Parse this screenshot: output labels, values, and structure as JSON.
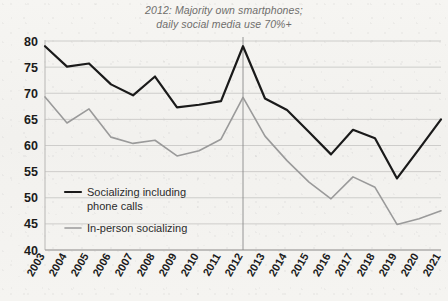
{
  "chart_data": {
    "type": "line",
    "title": "2012: Majority own smartphones; daily social media use 70%+",
    "title_line1": "2012: Majority own smartphones;",
    "title_line2": "daily social media use 70%+",
    "xlabel": "",
    "ylabel": "",
    "ylim": [
      40,
      80
    ],
    "ytick_labels": [
      "40",
      "45",
      "50",
      "55",
      "60",
      "65",
      "70",
      "75",
      "80"
    ],
    "yticks": [
      40,
      45,
      50,
      55,
      60,
      65,
      70,
      75,
      80
    ],
    "grid": "horizontal",
    "legend_position": "inside-lower-left",
    "categories": [
      "2003",
      "2004",
      "2005",
      "2006",
      "2007",
      "2008",
      "2009",
      "2010",
      "2011",
      "2012",
      "2013",
      "2014",
      "2015",
      "2016",
      "2017",
      "2018",
      "2019",
      "2020",
      "2021"
    ],
    "x": [
      2003,
      2004,
      2005,
      2006,
      2007,
      2008,
      2009,
      2010,
      2011,
      2012,
      2013,
      2014,
      2015,
      2016,
      2017,
      2018,
      2019,
      2020,
      2021
    ],
    "annotations": [
      {
        "type": "vertical-reference-line",
        "x": 2012,
        "color": "#8a8a8a"
      }
    ],
    "series": [
      {
        "name": "Socializing including phone calls",
        "legend_label_line1": "Socializing including",
        "legend_label_line2": "phone calls",
        "color": "#1a1a1a",
        "values": [
          79.0,
          75.1,
          75.7,
          71.7,
          69.6,
          73.2,
          67.3,
          67.8,
          68.5,
          79.0,
          69.0,
          66.8,
          62.6,
          58.3,
          63.0,
          61.4,
          53.7,
          59.3,
          65.0
        ]
      },
      {
        "name": "In-person socializing",
        "legend_label_line1": "In-person socializing",
        "legend_label_line2": "",
        "color": "#9a9a9a",
        "values": [
          69.3,
          64.3,
          67.0,
          61.6,
          60.4,
          61.0,
          58.0,
          59.0,
          61.2,
          69.2,
          61.8,
          57.1,
          53.0,
          49.8,
          54.0,
          52.0,
          44.9,
          46.0,
          47.5
        ]
      }
    ]
  },
  "legend": {
    "items": [
      {
        "label_line1": "Socializing including",
        "label_line2": "phone calls",
        "color": "#1a1a1a"
      },
      {
        "label_line1": "In-person socializing",
        "label_line2": "",
        "color": "#9a9a9a"
      }
    ]
  }
}
